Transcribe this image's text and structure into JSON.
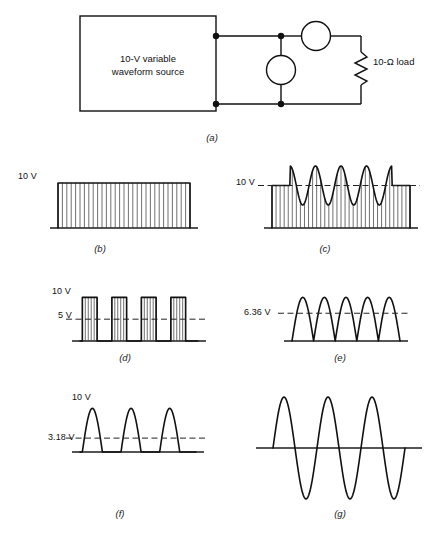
{
  "figure": {
    "captions": {
      "a": "(a)",
      "b": "(b)",
      "c": "(c)",
      "d": "(d)",
      "e": "(e)",
      "f": "(f)",
      "g": "(g)"
    }
  },
  "circuit": {
    "source_label_line1": "10-V variable",
    "source_label_line2": "waveform source",
    "load_label": "10-Ω load",
    "meters": [
      {
        "name": "series-meter",
        "kind": "ammeter-circle"
      },
      {
        "name": "shunt-meter",
        "kind": "voltmeter-circle"
      }
    ],
    "colors": {
      "line": "#111111",
      "node": "#111111"
    }
  },
  "chart_data": [
    {
      "id": "b",
      "type": "area",
      "title": "Pure dc level",
      "labels": [
        {
          "text": "10 V",
          "value": 10
        }
      ],
      "dc_level": 10,
      "ac_amplitude": 0,
      "cycles": 0,
      "ylim": [
        0,
        16
      ],
      "hatched": true,
      "hatch_count": 30,
      "dashed_levels": []
    },
    {
      "id": "c",
      "type": "area",
      "title": "dc level with superimposed ac ripple",
      "labels": [
        {
          "text": "10 V",
          "value": 10
        }
      ],
      "dc_level": 10,
      "ac_amplitude": 4.6,
      "cycles": 4,
      "ylim": [
        0,
        16
      ],
      "hatched": true,
      "hatch_count": 34,
      "dashed_levels": [
        10
      ]
    },
    {
      "id": "d",
      "type": "bar",
      "title": "Square pulse train, 50% duty cycle",
      "labels": [
        {
          "text": "10 V",
          "value": 10
        },
        {
          "text": "5 V",
          "value": 5
        }
      ],
      "peak": 10,
      "average": 5,
      "pulses": 4,
      "duty": 0.5,
      "ylim": [
        0,
        12
      ],
      "hatched": true,
      "dashed_levels": [
        5
      ]
    },
    {
      "id": "e",
      "type": "line",
      "title": "Full-wave rectified sine",
      "labels": [
        {
          "text": "6.36 V",
          "value": 6.36
        }
      ],
      "peak": 10,
      "average": 6.36,
      "humps": 5,
      "ylim": [
        0,
        12
      ],
      "hatched": false,
      "dashed_levels": [
        6.36
      ]
    },
    {
      "id": "f",
      "type": "line",
      "title": "Half-wave rectified sine",
      "labels": [
        {
          "text": "10 V",
          "value": 10
        },
        {
          "text": "3.18 V",
          "value": 3.18
        }
      ],
      "peak": 10,
      "average": 3.18,
      "humps": 3,
      "ylim": [
        0,
        12
      ],
      "hatched": false,
      "dashed_levels": [
        3.18
      ]
    },
    {
      "id": "g",
      "type": "line",
      "title": "Pure ac sine wave, zero average",
      "labels": [],
      "peak": 10,
      "average": 0,
      "cycles": 3,
      "ylim": [
        -12,
        12
      ],
      "hatched": false,
      "dashed_levels": []
    }
  ]
}
